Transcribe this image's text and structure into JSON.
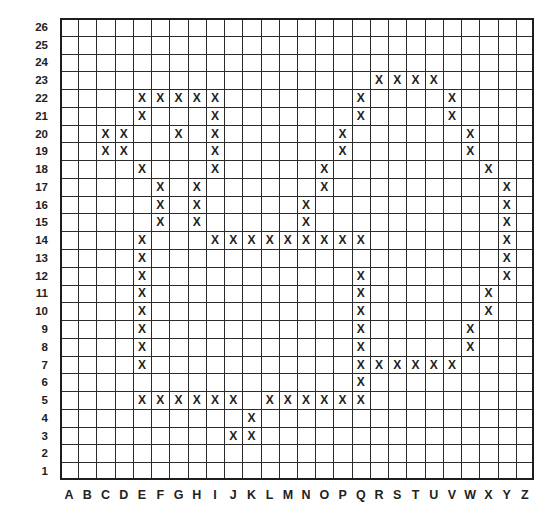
{
  "grid": {
    "columns": [
      "A",
      "B",
      "C",
      "D",
      "E",
      "F",
      "G",
      "H",
      "I",
      "J",
      "K",
      "L",
      "M",
      "N",
      "O",
      "P",
      "Q",
      "R",
      "S",
      "T",
      "U",
      "V",
      "W",
      "X",
      "Y",
      "Z"
    ],
    "rows": [
      26,
      25,
      24,
      23,
      22,
      21,
      20,
      19,
      18,
      17,
      16,
      15,
      14,
      13,
      12,
      11,
      10,
      9,
      8,
      7,
      6,
      5,
      4,
      3,
      2,
      1
    ],
    "mark_symbol": "X",
    "marks": [
      {
        "row": 23,
        "cols": [
          "R",
          "S",
          "T",
          "U"
        ]
      },
      {
        "row": 22,
        "cols": [
          "E",
          "F",
          "G",
          "H",
          "I",
          "Q",
          "V"
        ]
      },
      {
        "row": 21,
        "cols": [
          "E",
          "I",
          "Q",
          "V"
        ]
      },
      {
        "row": 20,
        "cols": [
          "C",
          "D",
          "G",
          "I",
          "P",
          "W"
        ]
      },
      {
        "row": 19,
        "cols": [
          "C",
          "D",
          "I",
          "P",
          "W"
        ]
      },
      {
        "row": 18,
        "cols": [
          "E",
          "I",
          "O",
          "X"
        ]
      },
      {
        "row": 17,
        "cols": [
          "F",
          "H",
          "O",
          "Y"
        ]
      },
      {
        "row": 16,
        "cols": [
          "F",
          "H",
          "N",
          "Y"
        ]
      },
      {
        "row": 15,
        "cols": [
          "F",
          "H",
          "N",
          "Y"
        ]
      },
      {
        "row": 14,
        "cols": [
          "E",
          "I",
          "J",
          "K",
          "L",
          "M",
          "N",
          "O",
          "P",
          "Q",
          "Y"
        ]
      },
      {
        "row": 13,
        "cols": [
          "E",
          "Y"
        ]
      },
      {
        "row": 12,
        "cols": [
          "E",
          "Q",
          "Y"
        ]
      },
      {
        "row": 11,
        "cols": [
          "E",
          "Q",
          "X"
        ]
      },
      {
        "row": 10,
        "cols": [
          "E",
          "Q",
          "X"
        ]
      },
      {
        "row": 9,
        "cols": [
          "E",
          "Q",
          "W"
        ]
      },
      {
        "row": 8,
        "cols": [
          "E",
          "Q",
          "W"
        ]
      },
      {
        "row": 7,
        "cols": [
          "E",
          "Q",
          "R",
          "S",
          "T",
          "U",
          "V"
        ]
      },
      {
        "row": 6,
        "cols": [
          "Q"
        ]
      },
      {
        "row": 5,
        "cols": [
          "E",
          "F",
          "G",
          "H",
          "I",
          "J",
          "L",
          "M",
          "N",
          "O",
          "P",
          "Q"
        ]
      },
      {
        "row": 4,
        "cols": [
          "K"
        ]
      },
      {
        "row": 3,
        "cols": [
          "J",
          "K"
        ]
      }
    ]
  }
}
